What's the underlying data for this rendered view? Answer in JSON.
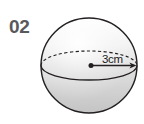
{
  "figure": {
    "item_number": "02",
    "type": "sphere-diagram",
    "background_color": "#ffffff",
    "label_color": "#58595b",
    "outline_color": "#231f20",
    "sphere": {
      "center_x": 89,
      "center_y": 65.5,
      "radius_x": 48,
      "radius_y": 47.5,
      "fill_top_color": "#f7f7f7",
      "fill_bottom_color": "#c9c9c9",
      "equator_ry": 14.5,
      "equator_back_style": "dashed",
      "equator_front_style": "solid"
    },
    "radius_annotation": {
      "label": "3cm",
      "value": 3,
      "unit": "cm",
      "from_x": 91,
      "from_y": 65.5,
      "to_x": 136,
      "to_y": 65.5,
      "arrow": "single-ended",
      "center_dot": true
    }
  }
}
